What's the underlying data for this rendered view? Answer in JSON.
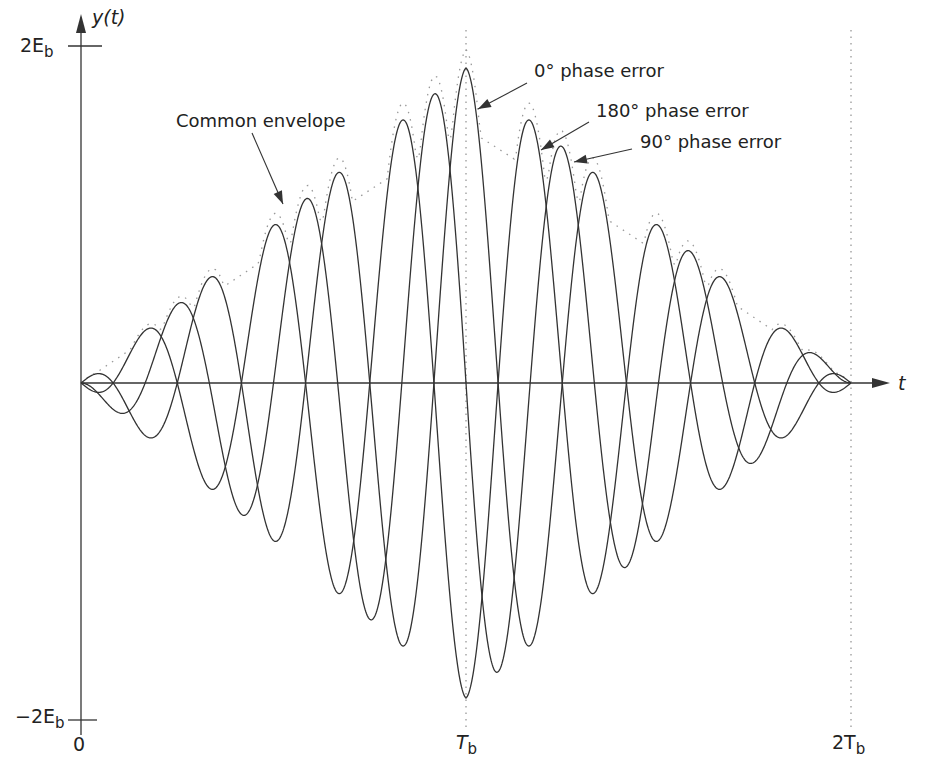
{
  "chart_data": {
    "type": "line",
    "title": "",
    "xlabel": "t",
    "ylabel": "y(t)",
    "x_ticks": [
      {
        "label": "0",
        "t": 0
      },
      {
        "label": "T",
        "sub": "b",
        "t": 1
      },
      {
        "label": "2T",
        "sub": "b",
        "t": 2
      }
    ],
    "y_ticks": [
      {
        "label": "2E",
        "sub": "b",
        "y": 2
      },
      {
        "label": "−2E",
        "sub": "b",
        "y": -2
      }
    ],
    "xlim": [
      0,
      2
    ],
    "ylim": [
      -2,
      2
    ],
    "grid": false,
    "model": "y(t) = envelope(t) * cos(2*pi*cycles_per_Tb*t + phase); envelope triangular, peak at T_b",
    "cycles_per_Tb": 3,
    "peak_amplitude": 1.87,
    "series": [
      {
        "name": "0° phase error",
        "phase_deg": 0,
        "style": "solid"
      },
      {
        "name": "90° phase error",
        "phase_deg": 90,
        "style": "solid"
      },
      {
        "name": "180° phase error",
        "phase_deg": 180,
        "style": "solid"
      },
      {
        "name": "Common envelope",
        "style": "dotted"
      }
    ],
    "annotations": [
      {
        "text": "Common envelope",
        "points_to": "envelope"
      },
      {
        "text": "0° phase error",
        "points_to": "0° curve near T_b"
      },
      {
        "text": "180° phase error",
        "points_to": "180° curve"
      },
      {
        "text": "90° phase error",
        "points_to": "90° curve"
      }
    ],
    "reference_lines": [
      {
        "type": "vertical-dotted",
        "t": 1
      },
      {
        "type": "vertical-dotted",
        "t": 2
      }
    ]
  },
  "labels": {
    "ylabel": "y(t)",
    "xlabel": "t",
    "ytop": "2E",
    "ybot": "−2E",
    "sub_b": "b",
    "x0": "0",
    "xTb": "T",
    "x2Tb": "2T",
    "ann_env": "Common envelope",
    "ann_0": "0° phase error",
    "ann_180": "180° phase error",
    "ann_90": "90° phase error"
  },
  "colors": {
    "curve": "#333333",
    "axis": "#333333",
    "dotted": "#999999"
  }
}
